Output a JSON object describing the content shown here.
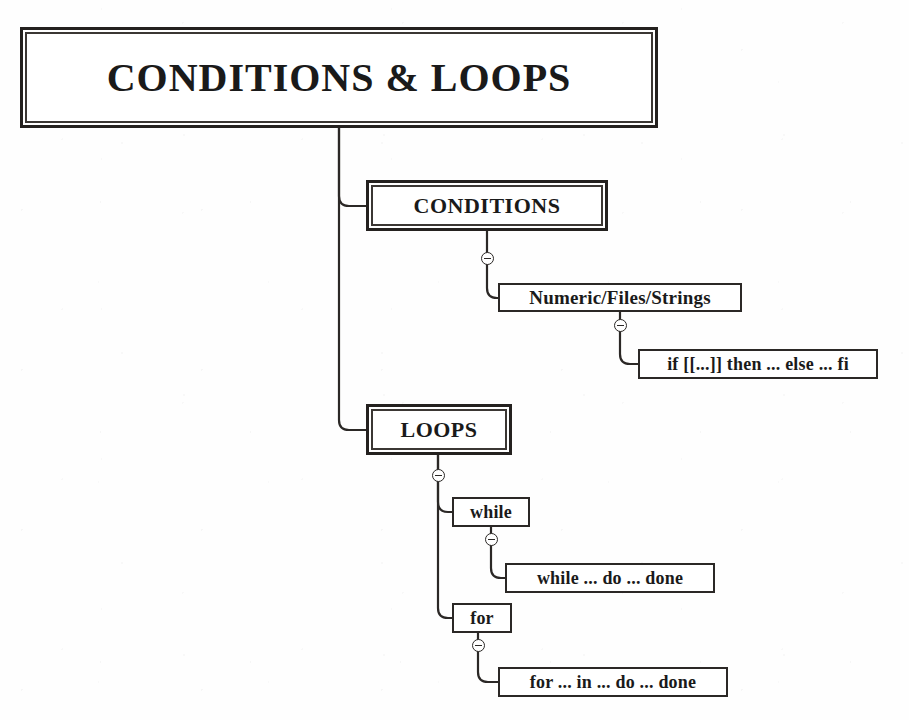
{
  "diagram": {
    "title": "CONDITIONS & LOOPS",
    "type": "mind-map",
    "palette": {
      "background": "#fefefe",
      "stroke": "#2b2826",
      "heavy_stroke": "#24211f",
      "text": "#1a1a1a",
      "node_fill": "#ffffff"
    },
    "root": {
      "id": "root",
      "label": "CONDITIONS & LOOPS",
      "style": "heavy",
      "box": {
        "x": 20,
        "y": 27,
        "w": 638,
        "h": 101
      }
    },
    "nodes": [
      {
        "id": "conditions",
        "label": "CONDITIONS",
        "style": "heavy",
        "level": 1,
        "box": {
          "x": 366,
          "y": 180,
          "w": 242,
          "h": 51
        }
      },
      {
        "id": "numeric-files-strings",
        "label": "Numeric/Files/Strings",
        "style": "light",
        "level": 2,
        "box": {
          "x": 498,
          "y": 283,
          "w": 244,
          "h": 29
        }
      },
      {
        "id": "if-statement",
        "label": "if [[...]] then ... else ... fi",
        "style": "light",
        "level": 3,
        "box": {
          "x": 638,
          "y": 349,
          "w": 240,
          "h": 30
        }
      },
      {
        "id": "loops",
        "label": "LOOPS",
        "style": "heavy",
        "level": 1,
        "box": {
          "x": 366,
          "y": 404,
          "w": 146,
          "h": 51
        }
      },
      {
        "id": "while",
        "label": "while",
        "style": "light",
        "level": 2,
        "box": {
          "x": 452,
          "y": 497,
          "w": 78,
          "h": 30
        }
      },
      {
        "id": "while-do-done",
        "label": "while ... do ... done",
        "style": "light",
        "level": 3,
        "box": {
          "x": 505,
          "y": 563,
          "w": 210,
          "h": 30
        }
      },
      {
        "id": "for",
        "label": "for",
        "style": "light",
        "level": 2,
        "box": {
          "x": 452,
          "y": 603,
          "w": 60,
          "h": 30
        }
      },
      {
        "id": "for-in-do-done",
        "label": "for ... in ... do ... done",
        "style": "light",
        "level": 3,
        "box": {
          "x": 498,
          "y": 667,
          "w": 230,
          "h": 30
        }
      }
    ],
    "toggles": [
      {
        "id": "toggle-conditions",
        "owner": "conditions",
        "state": "expanded",
        "icon": "minus-circle-icon",
        "x": 481,
        "y": 252
      },
      {
        "id": "toggle-numeric",
        "owner": "numeric-files-strings",
        "state": "expanded",
        "icon": "minus-circle-icon",
        "x": 614,
        "y": 319
      },
      {
        "id": "toggle-loops",
        "owner": "loops",
        "state": "expanded",
        "icon": "minus-circle-icon",
        "x": 432,
        "y": 469
      },
      {
        "id": "toggle-while",
        "owner": "while",
        "state": "expanded",
        "icon": "minus-circle-icon",
        "x": 485,
        "y": 533
      },
      {
        "id": "toggle-for",
        "owner": "for",
        "state": "expanded",
        "icon": "minus-circle-icon",
        "x": 472,
        "y": 639
      }
    ],
    "edges": [
      {
        "id": "edge-root-conditions",
        "from": "root",
        "to": "conditions"
      },
      {
        "id": "edge-root-loops",
        "from": "root",
        "to": "loops"
      },
      {
        "id": "edge-conditions-numeric",
        "from": "conditions",
        "to": "numeric-files-strings"
      },
      {
        "id": "edge-numeric-if",
        "from": "numeric-files-strings",
        "to": "if-statement"
      },
      {
        "id": "edge-loops-while",
        "from": "loops",
        "to": "while"
      },
      {
        "id": "edge-while-whiledo",
        "from": "while",
        "to": "while-do-done"
      },
      {
        "id": "edge-loops-for",
        "from": "loops",
        "to": "for"
      },
      {
        "id": "edge-for-forin",
        "from": "for",
        "to": "for-in-do-done"
      }
    ]
  }
}
